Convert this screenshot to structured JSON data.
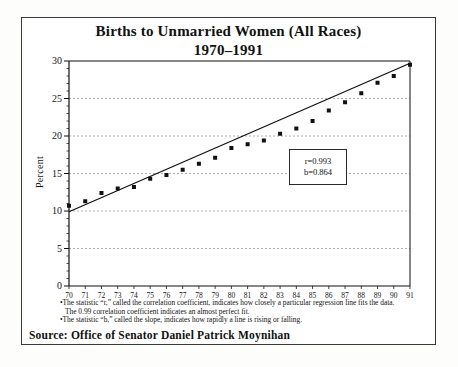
{
  "title": {
    "line1": "Births to Unmarried Women (All Races)",
    "line2": "1970–1991"
  },
  "chart_data": {
    "type": "scatter",
    "title": "Births to Unmarried Women (All Races) 1970–1991",
    "xlabel": "",
    "ylabel": "Percent",
    "categories": [
      "70",
      "71",
      "72",
      "73",
      "74",
      "75",
      "76",
      "77",
      "78",
      "79",
      "80",
      "81",
      "82",
      "83",
      "84",
      "85",
      "86",
      "87",
      "88",
      "89",
      "90",
      "91"
    ],
    "values": [
      10.7,
      11.3,
      12.4,
      13.0,
      13.2,
      14.3,
      14.8,
      15.5,
      16.3,
      17.1,
      18.4,
      18.9,
      19.4,
      20.3,
      21.0,
      22.0,
      23.4,
      24.5,
      25.7,
      27.1,
      28.0,
      29.5
    ],
    "ylim": [
      0,
      30
    ],
    "yticks": [
      0,
      5,
      10,
      15,
      20,
      25,
      30
    ],
    "y_minor_step": 1,
    "grid": "horizontal-dashed",
    "marker": "black-square",
    "legend": "none",
    "regression_line": {
      "start_value": 9.9,
      "end_value": 29.7,
      "r": 0.993,
      "b": 0.864
    }
  },
  "annotation": {
    "r_text": "r=0.993",
    "b_text": "b=0.864"
  },
  "footnotes": [
    "•The statistic “r,” called the correlation coefficient, indicates how closely a particular regression line fits the data.",
    "The 0.99 correlation coefficient indicates an almost perfect fit.",
    "•The statistic “b,” called the slope, indicates how rapidly a line is rising or falling."
  ],
  "source": "Source: Office of Senator Daniel Patrick Moynihan",
  "colors": {
    "ink": "#111111",
    "grid": "#999999",
    "background": "#ffffff"
  }
}
